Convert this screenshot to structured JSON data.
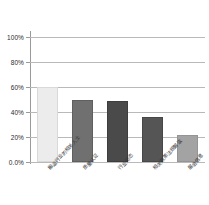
{
  "chart_data": {
    "type": "bar",
    "title": "",
    "xlabel": "",
    "ylabel": "",
    "ylim": [
      0,
      100
    ],
    "grid": true,
    "legend": "none",
    "unit": "%",
    "categories": [
      "搬运行业的相关人士",
      "质量认证",
      "行业动态",
      "相关政策法规解读",
      "展会信息"
    ],
    "values": [
      60,
      50,
      49,
      36,
      22
    ],
    "yticks": [
      0,
      20,
      40,
      60,
      80,
      100
    ],
    "ytick_labels": [
      "0.0%",
      "20%",
      "40%",
      "60%",
      "80%",
      "100%"
    ],
    "bar_colors": [
      "#ececec",
      "#707070",
      "#4a4a4a",
      "#555555",
      "#a3a3a3"
    ],
    "bar_edge_colors": [
      "#d9d9d9",
      "#5f5f5f",
      "#3d3d3d",
      "#474747",
      "#949494"
    ],
    "axis_color": "#9a9a9a",
    "grid_color": "#b9b9b9"
  }
}
